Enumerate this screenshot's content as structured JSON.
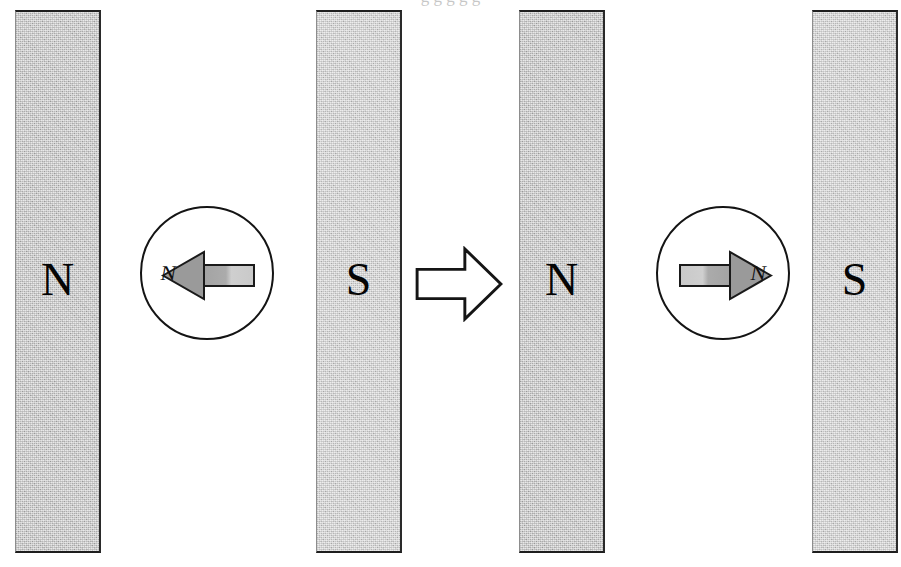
{
  "figure": {
    "background_color": "#ffffff",
    "width": 901,
    "height": 567,
    "clipped_caption_above": "g g g g g"
  },
  "magnets": [
    {
      "id": "magnet-1",
      "pole_label": "N",
      "x": 15,
      "y": 10,
      "width": 86,
      "height": 543,
      "fill": "#b7b7b7",
      "tone": "tone-dark"
    },
    {
      "id": "magnet-2",
      "pole_label": "S",
      "x": 316,
      "y": 10,
      "width": 86,
      "height": 543,
      "fill": "#c8c8c8",
      "tone": "tone-light"
    },
    {
      "id": "magnet-3",
      "pole_label": "N",
      "x": 519,
      "y": 10,
      "width": 86,
      "height": 543,
      "fill": "#b7b7b7",
      "tone": "tone-dark"
    },
    {
      "id": "magnet-4",
      "pole_label": "S",
      "x": 812,
      "y": 10,
      "width": 86,
      "height": 543,
      "fill": "#c8c8c8",
      "tone": "tone-light"
    }
  ],
  "compasses": [
    {
      "id": "compass-left",
      "center_x": 207,
      "center_y": 273,
      "radius": 67,
      "needle_direction": "left",
      "needle_label": "N",
      "head_fill": "#9a9a9a",
      "tail_fill": "#cfcfcf",
      "outline": "#141414"
    },
    {
      "id": "compass-right",
      "center_x": 723,
      "center_y": 273,
      "radius": 67,
      "needle_direction": "right",
      "needle_label": "N",
      "head_fill": "#9a9a9a",
      "tail_fill": "#cfcfcf",
      "outline": "#141414"
    }
  ],
  "flow_arrow": {
    "id": "flow-arrow",
    "direction": "right",
    "x": 414,
    "y": 246,
    "width": 90,
    "height": 76,
    "fill": "#ffffff",
    "stroke": "#151515"
  },
  "colors": {
    "magnet_dark": "#b7b7b7",
    "magnet_light": "#c8c8c8",
    "needle_head": "#9a9a9a",
    "needle_tail": "#cfcfcf",
    "ink": "#141414",
    "page": "#ffffff"
  }
}
